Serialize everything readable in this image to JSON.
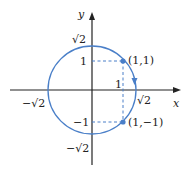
{
  "diagram": {
    "type": "coordinate-plane",
    "colors": {
      "axes": "#222222",
      "circle": "#4a7fc8",
      "dashed": "#4a7fc8",
      "points": "#4a7fc8",
      "text": "#222222"
    },
    "axes": {
      "x_label": "x",
      "y_label": "y"
    },
    "circle": {
      "center": [
        0,
        0
      ],
      "radius_label": "√2",
      "orientation_arrow": "clockwise"
    },
    "tick_labels": {
      "x_pos_sqrt2": "√2",
      "x_neg_sqrt2": "−√2",
      "y_pos_sqrt2": "√2",
      "y_neg_sqrt2": "−√2",
      "y_one": "1",
      "y_neg_one": "−1",
      "x_one": "1"
    },
    "points": [
      {
        "label": "(1,1)",
        "x": 1,
        "y": 1
      },
      {
        "label": "(1,−1)",
        "x": 1,
        "y": -1
      }
    ]
  }
}
